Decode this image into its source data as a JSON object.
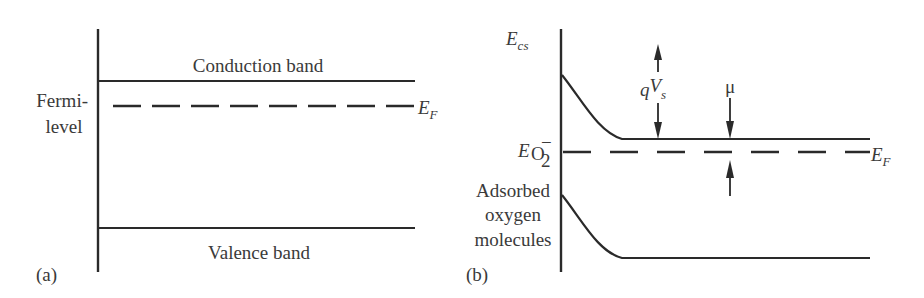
{
  "figure": {
    "panel_a": {
      "tag": "(a)",
      "conduction_band_label": "Conduction band",
      "valence_band_label": "Valence band",
      "fermi_label_line1": "Fermi-",
      "fermi_label_line2": "level",
      "ef_symbol": "E",
      "ef_subscript": "F"
    },
    "panel_b": {
      "tag": "(b)",
      "ecs_symbol": "E",
      "ecs_subscript": "cs",
      "eo2_symbol": "E",
      "eo2_subscript": "O",
      "eo2_subscript_2": "2",
      "eo2_superscript": "−",
      "adsorbed_line1": "Adsorbed",
      "adsorbed_line2": "oxygen",
      "adsorbed_line3": "molecules",
      "qvs_q": "q",
      "qvs_v": "V",
      "qvs_sub": "s",
      "mu_label": "μ",
      "ef_symbol": "E",
      "ef_subscript": "F"
    },
    "colors": {
      "line": "#2a2a2a",
      "text": "#3a3a3a",
      "background": "#ffffff"
    }
  }
}
